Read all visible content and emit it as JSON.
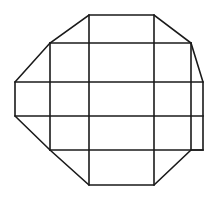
{
  "diagram": {
    "type": "grid-polygon-net",
    "canvas": {
      "width": 214,
      "height": 201,
      "background": "#ffffff"
    },
    "stroke_color": "#1a1a1a",
    "outline": [
      [
        89,
        15
      ],
      [
        154,
        15
      ],
      [
        191,
        43
      ],
      [
        203,
        82
      ],
      [
        203,
        150
      ],
      [
        191,
        150
      ],
      [
        154,
        185
      ],
      [
        89,
        185
      ],
      [
        50,
        150
      ],
      [
        15,
        116
      ],
      [
        15,
        82
      ],
      [
        50,
        43
      ]
    ],
    "segments": [
      {
        "name": "h-line-43",
        "x1": 50,
        "y1": 43,
        "x2": 191,
        "y2": 43
      },
      {
        "name": "h-line-82",
        "x1": 15,
        "y1": 82,
        "x2": 203,
        "y2": 82
      },
      {
        "name": "h-line-116",
        "x1": 15,
        "y1": 116,
        "x2": 203,
        "y2": 116
      },
      {
        "name": "h-line-150",
        "x1": 50,
        "y1": 150,
        "x2": 203,
        "y2": 150
      },
      {
        "name": "v-line-50",
        "x1": 50,
        "y1": 43,
        "x2": 50,
        "y2": 150
      },
      {
        "name": "v-line-89",
        "x1": 89,
        "y1": 15,
        "x2": 89,
        "y2": 185
      },
      {
        "name": "v-line-154",
        "x1": 154,
        "y1": 15,
        "x2": 154,
        "y2": 185
      },
      {
        "name": "v-line-191",
        "x1": 191,
        "y1": 43,
        "x2": 191,
        "y2": 150
      }
    ]
  }
}
